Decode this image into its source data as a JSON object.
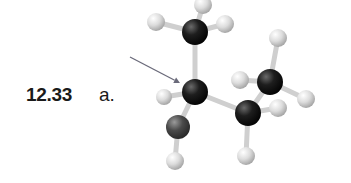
{
  "figure": {
    "problem_number": "12.33",
    "part_label": "a."
  },
  "colors": {
    "carbon": "#1c1c1c",
    "oxygen": "#4a4a4a",
    "hydrogen": "#d9d9d9",
    "bond": "#cfcfcf",
    "arrow": "#6a6a7a"
  },
  "arrow": {
    "from": [
      130,
      57
    ],
    "to": [
      180,
      83
    ]
  },
  "atoms": [
    {
      "id": "H1",
      "el": "H",
      "x": 203,
      "y": 5,
      "r": 9
    },
    {
      "id": "H2",
      "el": "H",
      "x": 156,
      "y": 22,
      "r": 9
    },
    {
      "id": "H3",
      "el": "H",
      "x": 225,
      "y": 24,
      "r": 9
    },
    {
      "id": "H4",
      "el": "H",
      "x": 278,
      "y": 38,
      "r": 9
    },
    {
      "id": "H5",
      "el": "H",
      "x": 240,
      "y": 80,
      "r": 9
    },
    {
      "id": "H6",
      "el": "H",
      "x": 306,
      "y": 99,
      "r": 9
    },
    {
      "id": "H7",
      "el": "H",
      "x": 164,
      "y": 97,
      "r": 8
    },
    {
      "id": "H8",
      "el": "H",
      "x": 278,
      "y": 108,
      "r": 9
    },
    {
      "id": "H9",
      "el": "H",
      "x": 175,
      "y": 161,
      "r": 9
    },
    {
      "id": "H10",
      "el": "H",
      "x": 246,
      "y": 156,
      "r": 9
    },
    {
      "id": "C1",
      "el": "C",
      "x": 195,
      "y": 32,
      "r": 13
    },
    {
      "id": "C4",
      "el": "C",
      "x": 270,
      "y": 82,
      "r": 13
    },
    {
      "id": "C2",
      "el": "C",
      "x": 195,
      "y": 92,
      "r": 13
    },
    {
      "id": "C3",
      "el": "C",
      "x": 248,
      "y": 113,
      "r": 13
    },
    {
      "id": "O",
      "el": "O",
      "x": 178,
      "y": 127,
      "r": 12
    }
  ],
  "bonds": [
    [
      "C1",
      "H1"
    ],
    [
      "C1",
      "H2"
    ],
    [
      "C1",
      "H3"
    ],
    [
      "C1",
      "C2"
    ],
    [
      "C2",
      "H7"
    ],
    [
      "C2",
      "O"
    ],
    [
      "C2",
      "C3"
    ],
    [
      "O",
      "H9"
    ],
    [
      "C3",
      "H10"
    ],
    [
      "C3",
      "H8"
    ],
    [
      "C3",
      "C4"
    ],
    [
      "C4",
      "H4"
    ],
    [
      "C4",
      "H5"
    ],
    [
      "C4",
      "H6"
    ]
  ]
}
